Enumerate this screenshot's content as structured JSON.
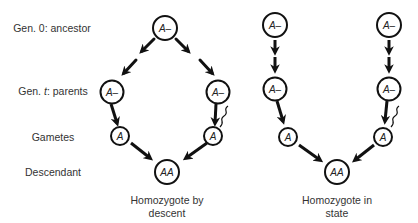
{
  "row_labels": {
    "gen0": {
      "prefix": "Gen. 0: ancestor"
    },
    "gent": {
      "prefix": "Gen. ",
      "italic": "t",
      "suffix": ": parents"
    },
    "gametes": "Gametes",
    "descendant": "Descendant"
  },
  "panels": [
    {
      "caption_line1": "Homozygote by",
      "caption_line2": "descent",
      "nodes": {
        "ancestor": "A–",
        "parent_left": "A–",
        "parent_right": "A–",
        "gamete_left": "A",
        "gamete_right": "A",
        "descendant": "AA"
      }
    },
    {
      "caption_line1": "Homozygote in",
      "caption_line2": "state",
      "nodes": {
        "ancestor_left": "A–",
        "ancestor_right": "A–",
        "parent_left": "A–",
        "parent_right": "A–",
        "gamete_left": "A",
        "gamete_right": "A",
        "descendant": "AA"
      }
    }
  ],
  "colors": {
    "stroke": "#111111",
    "text": "#333333",
    "background": "#ffffff"
  }
}
